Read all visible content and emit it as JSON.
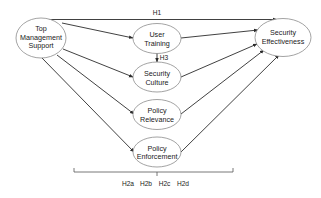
{
  "diagram": {
    "nodes": {
      "tms": {
        "lines": [
          "Top",
          "Management",
          "Support"
        ]
      },
      "ut": {
        "lines": [
          "User",
          "Training"
        ]
      },
      "sc": {
        "lines": [
          "Security",
          "Culture"
        ]
      },
      "pr": {
        "lines": [
          "Policy",
          "Relevance"
        ]
      },
      "pe": {
        "lines": [
          "Policy",
          "Enforcement"
        ]
      },
      "se": {
        "lines": [
          "Security",
          "Effectiveness"
        ]
      }
    },
    "hypotheses": {
      "h1": "H1",
      "h3": "H3",
      "h2": [
        "H2a",
        "H2b",
        "H2c",
        "H2d"
      ]
    },
    "colors": {
      "edge": "#2b2b2b",
      "ellipse_stroke": "#8c8c8c",
      "text": "#1a1a1a"
    }
  }
}
